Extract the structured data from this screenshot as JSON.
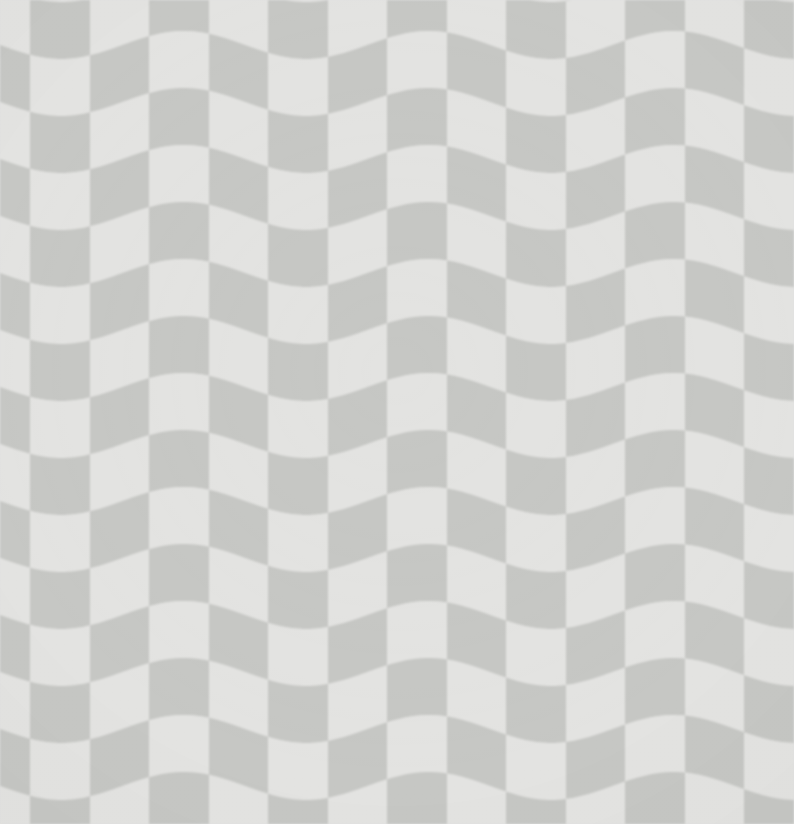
{
  "image": {
    "title": "Wavy Checkerboard Optical Illusion",
    "kind": "texture-pattern",
    "width": 794,
    "height": 824
  },
  "pattern": {
    "name": "wavy-checkerboard",
    "description": "Checkerboard of light and gray squares whose horizontal rows undulate in a sinusoidal wave while vertical column edges stay straight.",
    "cell_width": 59.5,
    "cell_height": 57,
    "columns": 14,
    "rows": 16,
    "column_offset_x": -29,
    "row_offset_y": -12,
    "colors": {
      "light": "#e3e3e1",
      "gray": "#c6c7c4",
      "background": "#dcdcda",
      "edge_soft": "#d4d4d2"
    },
    "wave": {
      "type": "sine",
      "axis": "horizontal",
      "period_px": 245,
      "amplitude_px": 14,
      "phase_px": 0,
      "phase_deg": 90,
      "direction": "rows-displaced-vertically"
    },
    "texture": {
      "grain_opacity": 0.35,
      "grain_strength": 6,
      "vignette_opacity": 0.85,
      "edge_blur_px": 0.8
    }
  },
  "chart_data": {
    "type": "heatmap",
    "title": "Wavy Checkerboard Optical Illusion",
    "xlabel": "",
    "ylabel": "",
    "grid": false,
    "legend": "none",
    "categories": [
      "light",
      "gray"
    ],
    "values": [
      0,
      1
    ]
  }
}
